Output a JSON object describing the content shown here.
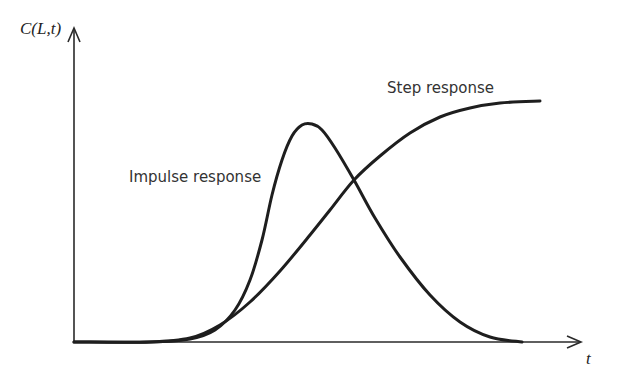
{
  "chart_data": {
    "type": "line",
    "title": "",
    "xlabel": "t",
    "ylabel": "C(L,t)",
    "grid": false,
    "legend": "none (inline curve annotations)",
    "axis_ticks": {
      "x": [],
      "y": []
    },
    "xlim_px": [
      74,
      582
    ],
    "ylim_px": [
      342,
      28
    ],
    "series": [
      {
        "name": "Impulse response",
        "description": "Skewed bell-shaped pulse rising from baseline, sharp peak, then slower decay back to baseline",
        "points": [
          [
            74,
            342
          ],
          [
            150,
            342
          ],
          [
            190,
            339
          ],
          [
            215,
            330
          ],
          [
            235,
            310
          ],
          [
            250,
            280
          ],
          [
            262,
            240
          ],
          [
            272,
            195
          ],
          [
            282,
            160
          ],
          [
            292,
            136
          ],
          [
            302,
            125
          ],
          [
            312,
            124
          ],
          [
            322,
            130
          ],
          [
            335,
            148
          ],
          [
            354,
            180
          ],
          [
            375,
            218
          ],
          [
            400,
            257
          ],
          [
            430,
            295
          ],
          [
            460,
            322
          ],
          [
            490,
            337
          ],
          [
            522,
            342
          ]
        ]
      },
      {
        "name": "Step response",
        "description": "S-shaped cumulative curve rising from baseline to a plateau",
        "points": [
          [
            74,
            342
          ],
          [
            150,
            342
          ],
          [
            190,
            338
          ],
          [
            220,
            325
          ],
          [
            250,
            302
          ],
          [
            280,
            271
          ],
          [
            310,
            235
          ],
          [
            330,
            210
          ],
          [
            354,
            180
          ],
          [
            380,
            156
          ],
          [
            410,
            133
          ],
          [
            440,
            117
          ],
          [
            470,
            108
          ],
          [
            500,
            103
          ],
          [
            540,
            101
          ]
        ]
      }
    ],
    "annotations": [
      {
        "text": "Impulse response",
        "x": 129,
        "y": 182
      },
      {
        "text": "Step response",
        "x": 387,
        "y": 93
      }
    ]
  },
  "labels": {
    "y_axis": "C(L,t)",
    "x_axis": "t",
    "impulse": "Impulse response",
    "step": "Step response"
  }
}
